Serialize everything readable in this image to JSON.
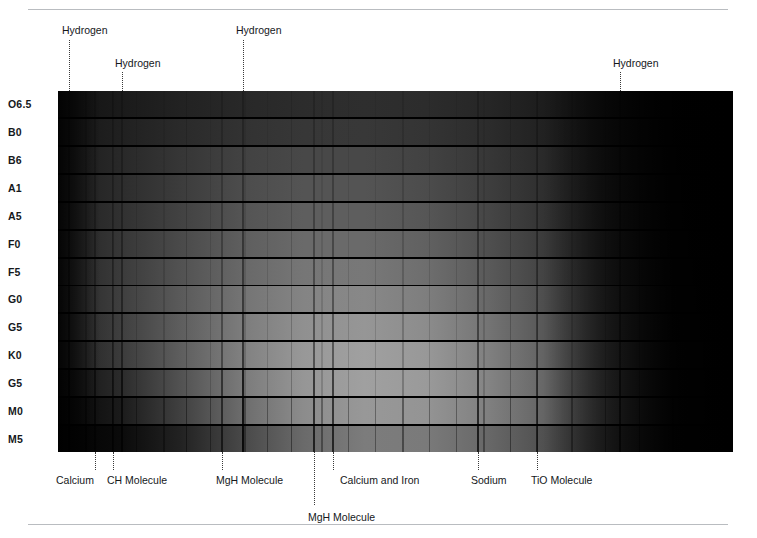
{
  "figure": {
    "plate_background": "#000000"
  },
  "chart_data": {
    "type": "heatmap",
    "xlabel": "Wavelength (increasing to the right)",
    "ylabel": "Spectral Class",
    "grid": false,
    "legend_position": "none",
    "categories": [
      "O6.5",
      "B0",
      "B6",
      "A1",
      "A5",
      "F0",
      "F5",
      "G0",
      "G5",
      "K0",
      "G5",
      "M0",
      "M5"
    ],
    "series": [
      {
        "name": "O6.5",
        "brightness_profile": [
          18,
          26,
          34,
          40,
          44,
          46,
          44,
          38,
          28,
          14,
          5,
          2
        ]
      },
      {
        "name": "B0",
        "brightness_profile": [
          22,
          32,
          42,
          50,
          55,
          56,
          52,
          44,
          32,
          16,
          6,
          2
        ]
      },
      {
        "name": "B6",
        "brightness_profile": [
          26,
          40,
          54,
          66,
          72,
          72,
          66,
          55,
          40,
          20,
          7,
          2
        ]
      },
      {
        "name": "A1",
        "brightness_profile": [
          28,
          44,
          60,
          76,
          84,
          84,
          76,
          62,
          45,
          22,
          8,
          2
        ]
      },
      {
        "name": "A5",
        "brightness_profile": [
          30,
          48,
          66,
          84,
          94,
          94,
          86,
          70,
          50,
          25,
          9,
          2
        ]
      },
      {
        "name": "F0",
        "brightness_profile": [
          32,
          54,
          74,
          94,
          106,
          106,
          97,
          79,
          57,
          28,
          10,
          3
        ]
      },
      {
        "name": "F5",
        "brightness_profile": [
          34,
          58,
          82,
          104,
          118,
          120,
          110,
          90,
          65,
          33,
          12,
          3
        ]
      },
      {
        "name": "G0",
        "brightness_profile": [
          34,
          62,
          90,
          116,
          132,
          136,
          126,
          104,
          75,
          39,
          14,
          3
        ]
      },
      {
        "name": "G5",
        "brightness_profile": [
          32,
          62,
          94,
          124,
          144,
          150,
          140,
          116,
          85,
          45,
          17,
          4
        ]
      },
      {
        "name": "K0",
        "brightness_profile": [
          28,
          58,
          94,
          128,
          152,
          160,
          152,
          128,
          96,
          52,
          20,
          4
        ]
      },
      {
        "name": "G5",
        "brightness_profile": [
          14,
          42,
          82,
          122,
          150,
          160,
          154,
          132,
          100,
          56,
          22,
          5
        ]
      },
      {
        "name": "M0",
        "brightness_profile": [
          6,
          26,
          64,
          108,
          140,
          152,
          148,
          128,
          98,
          56,
          22,
          5
        ]
      },
      {
        "name": "M5",
        "brightness_profile": [
          2,
          10,
          34,
          72,
          106,
          124,
          122,
          104,
          78,
          44,
          18,
          4
        ]
      }
    ],
    "top_annotations": [
      {
        "label": "Hydrogen",
        "x_px": 69,
        "label_x_px": 62,
        "label_y_px": 24,
        "tick_top_px": 40,
        "tick_bottom_px": 91
      },
      {
        "label": "Hydrogen",
        "x_px": 122,
        "label_x_px": 115,
        "label_y_px": 57,
        "tick_top_px": 72,
        "tick_bottom_px": 91
      },
      {
        "label": "Hydrogen",
        "x_px": 243,
        "label_x_px": 236,
        "label_y_px": 24,
        "tick_top_px": 40,
        "tick_bottom_px": 91
      },
      {
        "label": "Hydrogen",
        "x_px": 620,
        "label_x_px": 613,
        "label_y_px": 57,
        "tick_top_px": 72,
        "tick_bottom_px": 91
      }
    ],
    "bottom_annotations": [
      {
        "label": "Calcium",
        "x_px": 95,
        "label_x_px": 56,
        "label_y_px": 474,
        "tick_top_px": 452,
        "tick_bottom_px": 470
      },
      {
        "label": "CH Molecule",
        "x_px": 113,
        "label_x_px": 107,
        "label_y_px": 474,
        "tick_top_px": 452,
        "tick_bottom_px": 470
      },
      {
        "label": "MgH Molecule",
        "x_px": 222,
        "label_x_px": 216,
        "label_y_px": 474,
        "tick_top_px": 452,
        "tick_bottom_px": 470
      },
      {
        "label": "MgH Molecule",
        "x_px": 314,
        "label_x_px": 308,
        "label_y_px": 511,
        "tick_top_px": 452,
        "tick_bottom_px": 505
      },
      {
        "label": "Calcium and Iron",
        "x_px": 333,
        "label_x_px": 340,
        "label_y_px": 474,
        "tick_top_px": 452,
        "tick_bottom_px": 470
      },
      {
        "label": "Sodium",
        "x_px": 478,
        "label_x_px": 471,
        "label_y_px": 474,
        "tick_top_px": 452,
        "tick_bottom_px": 470
      },
      {
        "label": "TiO Molecule",
        "x_px": 537,
        "label_x_px": 531,
        "label_y_px": 474,
        "tick_top_px": 452,
        "tick_bottom_px": 470
      }
    ],
    "absorption_lines_px": [
      69,
      122,
      243,
      620,
      95,
      113,
      222,
      314,
      333,
      478,
      537
    ]
  },
  "rows": [
    {
      "label": "O6.5",
      "y_px": 96,
      "band_top_px": 91,
      "band_height_px": 26,
      "peak": 0.4,
      "peak_x": 0.4,
      "spread": 0.4
    },
    {
      "label": "B0",
      "y_px": 124,
      "band_top_px": 119,
      "band_height_px": 26,
      "peak": 0.46,
      "peak_x": 0.41,
      "spread": 0.4
    },
    {
      "label": "B6",
      "y_px": 152,
      "band_top_px": 147,
      "band_height_px": 26,
      "peak": 0.56,
      "peak_x": 0.42,
      "spread": 0.4
    },
    {
      "label": "A1",
      "y_px": 180,
      "band_top_px": 175,
      "band_height_px": 26,
      "peak": 0.62,
      "peak_x": 0.42,
      "spread": 0.4
    },
    {
      "label": "A5",
      "y_px": 208,
      "band_top_px": 203,
      "band_height_px": 26,
      "peak": 0.67,
      "peak_x": 0.43,
      "spread": 0.4
    },
    {
      "label": "F0",
      "y_px": 236,
      "band_top_px": 231,
      "band_height_px": 26,
      "peak": 0.72,
      "peak_x": 0.44,
      "spread": 0.4
    },
    {
      "label": "F5",
      "y_px": 264,
      "band_top_px": 259,
      "band_height_px": 26,
      "peak": 0.78,
      "peak_x": 0.45,
      "spread": 0.4
    },
    {
      "label": "G0",
      "y_px": 291,
      "band_top_px": 286,
      "band_height_px": 26,
      "peak": 0.84,
      "peak_x": 0.46,
      "spread": 0.4
    },
    {
      "label": "G5",
      "y_px": 319,
      "band_top_px": 314,
      "band_height_px": 26,
      "peak": 0.9,
      "peak_x": 0.47,
      "spread": 0.4
    },
    {
      "label": "K0",
      "y_px": 347,
      "band_top_px": 342,
      "band_height_px": 26,
      "peak": 0.95,
      "peak_x": 0.48,
      "spread": 0.4
    },
    {
      "label": "G5",
      "y_px": 375,
      "band_top_px": 370,
      "band_height_px": 26,
      "peak": 0.97,
      "peak_x": 0.5,
      "spread": 0.36
    },
    {
      "label": "M0",
      "y_px": 403,
      "band_top_px": 398,
      "band_height_px": 26,
      "peak": 0.93,
      "peak_x": 0.53,
      "spread": 0.32
    },
    {
      "label": "M5",
      "y_px": 431,
      "band_top_px": 426,
      "band_height_px": 26,
      "peak": 0.76,
      "peak_x": 0.56,
      "spread": 0.28
    }
  ]
}
